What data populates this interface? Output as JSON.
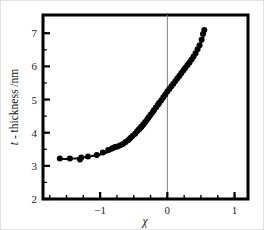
{
  "figure": {
    "background_color": "#ffffff",
    "frame_color": "#000000",
    "border_color": "#e2e2e2"
  },
  "chart_data": {
    "type": "scatter",
    "title": "",
    "subtitle": "",
    "xlabel": "χ",
    "ylabel": "t - thickness  /nm",
    "ylabel_parts": {
      "symbol": "t",
      "rest": " - thickness  /nm"
    },
    "xlim": [
      -1.85,
      1.2
    ],
    "ylim": [
      2,
      7.55
    ],
    "xticks": [
      -1,
      0,
      1
    ],
    "xtick_labels": [
      "−1",
      "0",
      "1"
    ],
    "yticks": [
      2,
      3,
      4,
      5,
      6,
      7
    ],
    "ytick_labels": [
      "2",
      "3",
      "4",
      "5",
      "6",
      "7"
    ],
    "x_minor_step": 0.25,
    "y_minor_step": 0.5,
    "grid": false,
    "legend": null,
    "legend_position": "none",
    "marker": "filled-circle",
    "marker_color": "#000000",
    "marker_size": 3.0,
    "line_color": "#000000",
    "line_width": 2.0,
    "reference_line": {
      "orientation": "vertical",
      "x": 0,
      "color": "#808080",
      "width": 1
    },
    "series": [
      {
        "name": "t - thickness",
        "x": [
          -1.6,
          -1.45,
          -1.3,
          -1.28,
          -1.18,
          -1.05,
          -0.96,
          -0.88,
          -0.82,
          -0.78,
          -0.74,
          -0.7,
          -0.66,
          -0.62,
          -0.58,
          -0.55,
          -0.52,
          -0.48,
          -0.45,
          -0.42,
          -0.39,
          -0.36,
          -0.33,
          -0.3,
          -0.28,
          -0.25,
          -0.22,
          -0.2,
          -0.17,
          -0.14,
          -0.12,
          -0.09,
          -0.06,
          -0.03,
          0.0,
          0.03,
          0.06,
          0.09,
          0.12,
          0.15,
          0.18,
          0.21,
          0.24,
          0.27,
          0.3,
          0.33,
          0.36,
          0.39,
          0.42,
          0.45,
          0.48,
          0.51,
          0.53,
          0.55
        ],
        "y": [
          3.22,
          3.22,
          3.19,
          3.25,
          3.28,
          3.33,
          3.4,
          3.48,
          3.53,
          3.57,
          3.58,
          3.62,
          3.66,
          3.72,
          3.78,
          3.84,
          3.9,
          3.97,
          4.04,
          4.11,
          4.18,
          4.25,
          4.32,
          4.4,
          4.46,
          4.54,
          4.62,
          4.68,
          4.76,
          4.84,
          4.9,
          4.98,
          5.07,
          5.15,
          5.24,
          5.32,
          5.4,
          5.48,
          5.56,
          5.64,
          5.72,
          5.8,
          5.88,
          5.96,
          6.04,
          6.12,
          6.21,
          6.3,
          6.4,
          6.52,
          6.64,
          6.8,
          6.98,
          7.1
        ]
      }
    ],
    "fit_curve": {
      "name": "fitted-curve",
      "x": [
        -1.62,
        -1.4,
        -1.2,
        -1.0,
        -0.85,
        -0.75,
        -0.65,
        -0.55,
        -0.45,
        -0.35,
        -0.25,
        -0.15,
        -0.05,
        0.05,
        0.15,
        0.25,
        0.35,
        0.45,
        0.52,
        0.57
      ],
      "y": [
        3.2,
        3.22,
        3.27,
        3.34,
        3.44,
        3.54,
        3.66,
        3.8,
        3.97,
        4.17,
        4.45,
        4.78,
        5.12,
        5.42,
        5.7,
        5.98,
        6.24,
        6.52,
        6.8,
        7.12
      ]
    }
  }
}
